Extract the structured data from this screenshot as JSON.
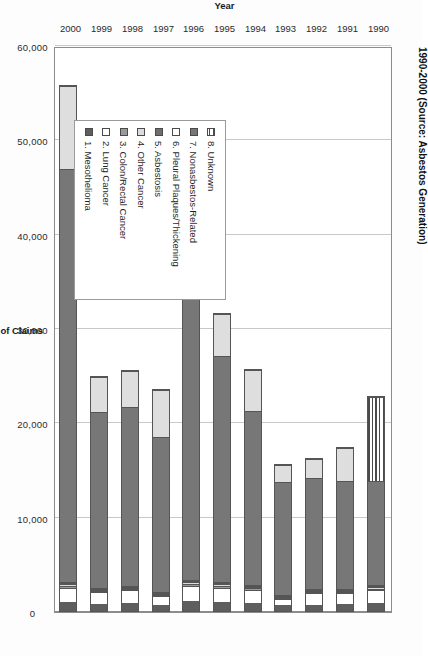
{
  "chart_data": {
    "type": "bar",
    "title": "1990-2000 (Source: Asbestos Generation)",
    "xlabel": "Year",
    "ylabel": "Number of Claims",
    "orientation": "vertical-stacked-rendered-sideways",
    "stacked": true,
    "grid": true,
    "legend_position": "inside-lower-left",
    "ylim": [
      0,
      60000
    ],
    "yticks": [
      "0",
      "10,000",
      "20,000",
      "30,000",
      "40,000",
      "50,000",
      "60,000"
    ],
    "ytick_values": [
      0,
      10000,
      20000,
      30000,
      40000,
      50000,
      60000
    ],
    "categories": [
      "1990",
      "1991",
      "1992",
      "1993",
      "1994",
      "1995",
      "1996",
      "1997",
      "1998",
      "1999",
      "2000"
    ],
    "series": [
      {
        "name": "1. Mesothelioma",
        "key": "meso",
        "color": "#5e5e5e",
        "values": [
          900,
          800,
          700,
          600,
          900,
          1000,
          1100,
          700,
          900,
          800,
          1000
        ]
      },
      {
        "name": "2. Lung Cancer",
        "key": "lung",
        "color": "#ffffff",
        "values": [
          1300,
          1100,
          1200,
          700,
          1400,
          1500,
          1600,
          900,
          1300,
          1200,
          1500
        ]
      },
      {
        "name": "3. Colon/Rectal Cancer",
        "key": "colon",
        "color": "#9a9a9a",
        "values": [
          200,
          150,
          150,
          100,
          150,
          200,
          200,
          100,
          150,
          150,
          200
        ]
      },
      {
        "name": "4. Other Cancer",
        "key": "other",
        "color": "#dcdcdc",
        "values": [
          150,
          120,
          120,
          80,
          120,
          150,
          150,
          80,
          120,
          120,
          150
        ]
      },
      {
        "name": "5. Asbestosis",
        "key": "asbestosis",
        "color": "#6e6e6e",
        "values": [
          100,
          80,
          80,
          60,
          80,
          100,
          100,
          60,
          80,
          80,
          100
        ]
      },
      {
        "name": "6. Pleural Plaques/Thickening",
        "key": "pleural",
        "color": "#ffffff",
        "values": [
          100,
          80,
          80,
          60,
          80,
          100,
          100,
          60,
          80,
          80,
          100
        ]
      },
      {
        "name": "7. Nonasbestos-Related",
        "key": "nonasb",
        "color": "#777777",
        "values": [
          11200,
          11600,
          11900,
          12300,
          18600,
          24200,
          44800,
          16700,
          19200,
          18800,
          44000
        ]
      },
      {
        "name": "8. Unknown",
        "key": "unknown",
        "color": "#dedede",
        "values": [
          9000,
          3600,
          2100,
          1800,
          4400,
          4500,
          2000,
          5000,
          3800,
          3800,
          8800
        ]
      }
    ],
    "totals": [
      23000,
      17500,
      16300,
      15700,
      25700,
      31800,
      50100,
      23600,
      25600,
      25000,
      55800
    ],
    "notes": {
      "1990_unknown_pattern": "horizontal-hatch"
    }
  },
  "legend": {
    "items": [
      {
        "label": "8. Unknown",
        "swatch": "unknown-hatch"
      },
      {
        "label": "7. Nonasbestos-Related",
        "swatch": "nonasb"
      },
      {
        "label": "6. Pleural Plaques/Thickening",
        "swatch": "pleural"
      },
      {
        "label": "5. Asbestosis",
        "swatch": "asbestosis"
      },
      {
        "label": "4. Other Cancer",
        "swatch": "other"
      },
      {
        "label": "3. Colon/Rectal Cancer",
        "swatch": "colon"
      },
      {
        "label": "2. Lung Cancer",
        "swatch": "lung"
      },
      {
        "label": "1. Mesothelioma",
        "swatch": "meso"
      }
    ]
  },
  "axes": {
    "y_label": "Number of Claims",
    "x_label": "Year"
  }
}
